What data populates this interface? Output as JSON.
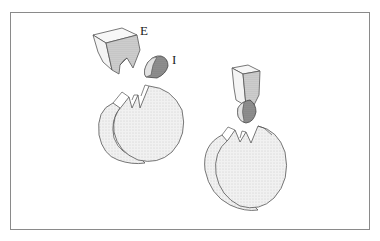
{
  "figure": {
    "labels": {
      "enzyme": "E",
      "inhibitor": "I"
    },
    "colors": {
      "frame": "#8a8a8a",
      "outline": "#555555",
      "stipple_light": "#ececec",
      "stipple_mid": "#cfcfcf",
      "inhibitor_dark": "#8c8c8c",
      "inhibitor_light": "#d6d6d6"
    }
  }
}
